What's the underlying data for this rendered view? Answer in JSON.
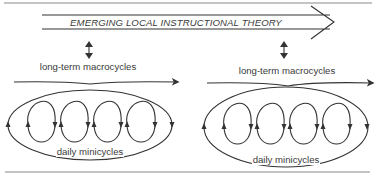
{
  "diagram": {
    "title_arrow": {
      "label": "EMERGING LOCAL INSTRUCTIONAL THEORY"
    },
    "left_group": {
      "macro_label": "long-term macrocycles",
      "mini_label": "daily minicycles"
    },
    "right_group": {
      "macro_label": "long-term macrocycles",
      "mini_label": "daily minicycles"
    },
    "colors": {
      "line": "#333333",
      "rule": "#8a8a8a",
      "background": "#ffffff"
    }
  }
}
